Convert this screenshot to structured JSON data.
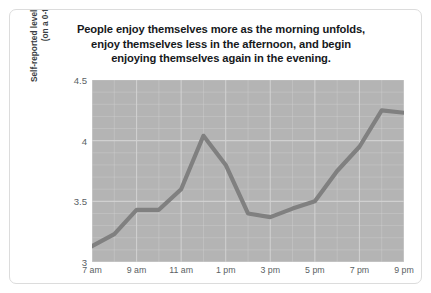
{
  "chart_data": {
    "type": "line",
    "title": "People enjoy themselves more as the morning unfolds, enjoy themselves less in the afternoon, and begin enjoying themselves again in the evening.",
    "title_lines": [
      "People enjoy themselves more as the morning unfolds,",
      "enjoy themselves less in the afternoon, and begin",
      "enjoying themselves again in the evening."
    ],
    "xlabel": "",
    "ylabel": "Self-reported levels of enjoying myself (on a 0-to-6 scale)",
    "ylabel_lines": [
      "Self-reported levels of enjoying myself",
      "(on a 0-to-6 scale)"
    ],
    "ylim": [
      3,
      4.5
    ],
    "y_ticks": [
      "3",
      "3.5",
      "4",
      "4.5"
    ],
    "y_tick_values": [
      3,
      3.5,
      4,
      4.5
    ],
    "x_ticks": [
      "7 am",
      "9 am",
      "11 am",
      "1 pm",
      "3 pm",
      "5 pm",
      "7 pm",
      "9 pm"
    ],
    "x_tick_values": [
      7,
      9,
      11,
      13,
      15,
      17,
      19,
      21
    ],
    "x_range": [
      7,
      21
    ],
    "grid": true,
    "legend": "none",
    "x": [
      7,
      8,
      9,
      10,
      11,
      12,
      13,
      14,
      15,
      16,
      17,
      18,
      19,
      20,
      21
    ],
    "x_point_labels": [
      "7 am",
      "8 am",
      "9 am",
      "10 am",
      "11 am",
      "12 pm",
      "1 pm",
      "2 pm",
      "3 pm",
      "4 pm",
      "5 pm",
      "6 pm",
      "7 pm",
      "8 pm",
      "9 pm"
    ],
    "values": [
      3.13,
      3.23,
      3.43,
      3.43,
      3.6,
      4.04,
      3.8,
      3.4,
      3.37,
      3.44,
      3.5,
      3.75,
      3.95,
      4.25,
      4.23
    ],
    "series": [
      {
        "name": "Self-reported levels of enjoying myself",
        "values": [
          3.13,
          3.23,
          3.43,
          3.43,
          3.6,
          4.04,
          3.8,
          3.4,
          3.37,
          3.44,
          3.5,
          3.75,
          3.95,
          4.25,
          4.23
        ]
      }
    ],
    "colors": {
      "line": "#808080",
      "plot_background": "#b4b4b4",
      "gridline": "#d2d2d2",
      "card_background": "#ffffff",
      "card_border": "#dcdcdc",
      "title_text": "#16191c",
      "tick_text": "#5a5f64"
    },
    "line_width": 4.2
  }
}
